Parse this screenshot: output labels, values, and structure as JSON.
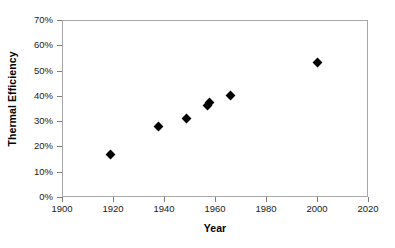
{
  "chart_data": {
    "type": "scatter",
    "title": "",
    "xlabel": "Year",
    "ylabel": "Thermal Efficiency",
    "xlim": [
      1900,
      2020
    ],
    "ylim": [
      0,
      70
    ],
    "xticks": [
      "1900",
      "1920",
      "1940",
      "1960",
      "1980",
      "2000",
      "2020"
    ],
    "xtick_values": [
      1900,
      1920,
      1940,
      1960,
      1980,
      2000,
      2020
    ],
    "yticks": [
      "0%",
      "10%",
      "20%",
      "30%",
      "40%",
      "50%",
      "60%",
      "70%"
    ],
    "ytick_values": [
      0,
      10,
      20,
      30,
      40,
      50,
      60,
      70
    ],
    "grid": false,
    "legend": false,
    "marker": "diamond",
    "marker_color": "#000000",
    "series": [
      {
        "name": "Thermal Efficiency",
        "points": [
          {
            "x": 1919,
            "y": 17.0
          },
          {
            "x": 1938,
            "y": 28.0
          },
          {
            "x": 1949,
            "y": 31.0
          },
          {
            "x": 1957,
            "y": 36.0
          },
          {
            "x": 1958,
            "y": 37.5
          },
          {
            "x": 1966,
            "y": 40.0
          },
          {
            "x": 2000,
            "y": 53.0
          }
        ]
      }
    ]
  }
}
